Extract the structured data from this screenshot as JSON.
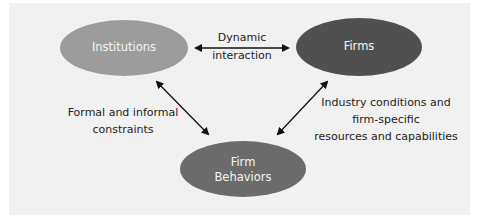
{
  "diagram": {
    "nodes": [
      {
        "id": "institutions",
        "label": "Institutions",
        "color": "#9c9c9c"
      },
      {
        "id": "firms",
        "label": "Firms",
        "color": "#505050"
      },
      {
        "id": "firm_behaviors",
        "label_line1": "Firm",
        "label_line2": "Behaviors",
        "color": "#6b6b6b"
      }
    ],
    "edges": [
      {
        "from": "institutions",
        "to": "firms",
        "direction": "both",
        "label_line1": "Dynamic",
        "label_line2": "interaction"
      },
      {
        "from": "institutions",
        "to": "firm_behaviors",
        "direction": "both",
        "label_line1": "Formal and informal",
        "label_line2": "constraints"
      },
      {
        "from": "firms",
        "to": "firm_behaviors",
        "direction": "both",
        "label_line1": "Industry conditions and",
        "label_line2": "firm-specific",
        "label_line3": "resources and capabilities"
      }
    ],
    "background": "#f1f1f1"
  }
}
